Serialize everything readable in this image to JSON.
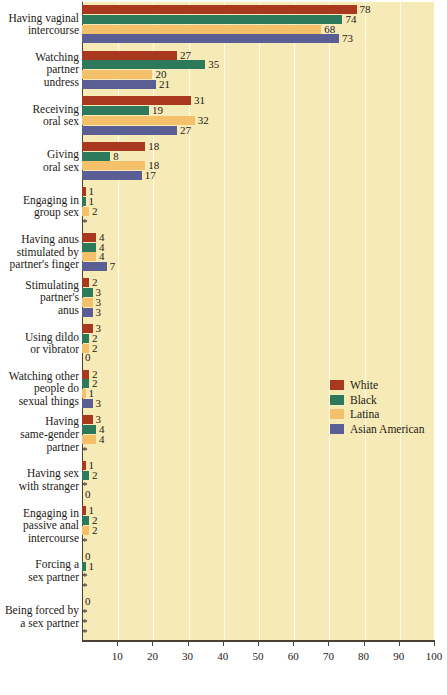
{
  "chart_data": {
    "type": "bar",
    "orientation": "horizontal",
    "title": "",
    "xlabel": "",
    "ylabel": "",
    "xlim": [
      0,
      100
    ],
    "xticks": [
      10,
      20,
      30,
      40,
      50,
      60,
      70,
      80,
      90,
      100
    ],
    "grid": true,
    "legend_position": "right-middle",
    "footnote_symbol": "*",
    "categories": [
      "Having vaginal intercourse",
      "Watching partner undress",
      "Receiving oral sex",
      "Giving oral sex",
      "Engaging in group sex",
      "Having anus stimulated by partner's finger",
      "Stimulating partner's anus",
      "Using dildo or vibrator",
      "Watching other people do sexual things",
      "Having same-gender partner",
      "Having sex with stranger",
      "Engaging in passive anal intercourse",
      "Forcing a sex partner",
      "Being forced by a sex partner"
    ],
    "series": [
      {
        "name": "White",
        "color": "#a8391f",
        "values": [
          78,
          27,
          31,
          18,
          1,
          4,
          2,
          3,
          2,
          3,
          1,
          1,
          0,
          0
        ]
      },
      {
        "name": "Black",
        "color": "#2c7a5b",
        "values": [
          74,
          35,
          19,
          8,
          1,
          4,
          3,
          2,
          2,
          4,
          2,
          2,
          1,
          "*"
        ]
      },
      {
        "name": "Latina",
        "color": "#f5c06a",
        "values": [
          68,
          20,
          32,
          18,
          2,
          4,
          3,
          2,
          1,
          4,
          "*",
          2,
          "*",
          "*"
        ]
      },
      {
        "name": "Asian American",
        "color": "#5a5e94",
        "values": [
          73,
          21,
          27,
          17,
          "*",
          7,
          3,
          0,
          3,
          "*",
          0,
          "*",
          "*",
          "*"
        ]
      }
    ]
  },
  "categories_display": [
    [
      "Having vaginal",
      "intercourse"
    ],
    [
      "Watching",
      "partner",
      "undress"
    ],
    [
      "Receiving",
      "oral sex"
    ],
    [
      "Giving",
      "oral sex"
    ],
    [
      "Engaging in",
      "group sex"
    ],
    [
      "Having anus",
      "stimulated by",
      "partner's finger"
    ],
    [
      "Stimulating",
      "partner's",
      "anus"
    ],
    [
      "Using dildo",
      "or vibrator"
    ],
    [
      "Watching other",
      "people do",
      "sexual things"
    ],
    [
      "Having",
      "same-gender",
      "partner"
    ],
    [
      "Having sex",
      "with stranger"
    ],
    [
      "Engaging in",
      "passive anal",
      "intercourse"
    ],
    [
      "Forcing a",
      "sex partner"
    ],
    [
      "Being forced by",
      "a sex partner"
    ]
  ],
  "legend": {
    "items": [
      {
        "label": "White",
        "color": "#a8391f"
      },
      {
        "label": "Black",
        "color": "#2c7a5b"
      },
      {
        "label": "Latina",
        "color": "#f5c06a"
      },
      {
        "label": "Asian American",
        "color": "#5a5e94"
      }
    ]
  },
  "axis": {
    "tick_labels": [
      "10",
      "20",
      "30",
      "40",
      "50",
      "60",
      "70",
      "80",
      "90",
      "100"
    ]
  },
  "colors": {
    "plot_background": "#f6eab6",
    "page_background": "#ffffff",
    "axis": "#4b4235",
    "text": "#1d1a16",
    "gridline": "#ffffff"
  }
}
